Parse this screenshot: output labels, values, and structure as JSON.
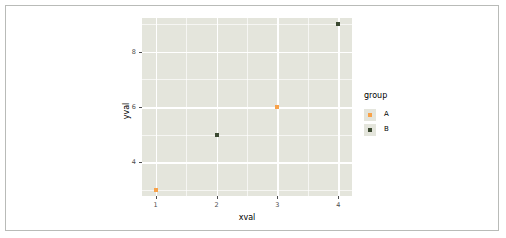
{
  "chart_data": {
    "type": "scatter",
    "title": "",
    "xlabel": "xval",
    "ylabel": "yval",
    "xlim": [
      0.775,
      4.225
    ],
    "ylim": [
      2.775,
      9.225
    ],
    "xticks": [
      "1",
      "2",
      "3",
      "4"
    ],
    "xtick_values": [
      1,
      2,
      3,
      4
    ],
    "yticks": [
      "4",
      "6",
      "8"
    ],
    "ytick_values": [
      4,
      6,
      8
    ],
    "x_minor_values": [
      1.5,
      2.5,
      3.5
    ],
    "y_minor_values": [
      3,
      5,
      7,
      9
    ],
    "grid": true,
    "legend": {
      "title": "group",
      "position": "right",
      "entries": [
        {
          "label": "A",
          "color": "#f8a24a"
        },
        {
          "label": "B",
          "color": "#3c4a32"
        }
      ]
    },
    "series": [
      {
        "name": "A",
        "color": "#f8a24a",
        "points": [
          {
            "x": 1,
            "y": 3
          },
          {
            "x": 3,
            "y": 6
          }
        ]
      },
      {
        "name": "B",
        "color": "#3c4a32",
        "points": [
          {
            "x": 2,
            "y": 5
          },
          {
            "x": 4,
            "y": 9
          }
        ]
      }
    ],
    "panel_background": "#e4e5dc",
    "gridline_color": "#ffffff",
    "plot_background": "#ffffff",
    "border_color": "#b9bbb8"
  }
}
